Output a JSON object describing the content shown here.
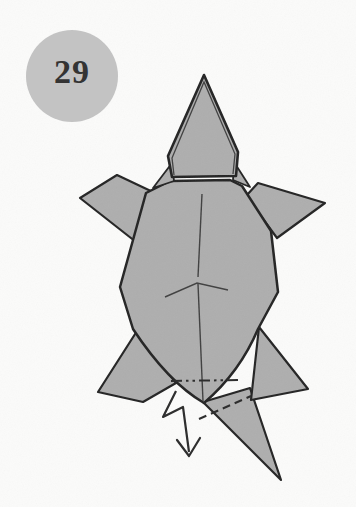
{
  "page": {
    "background": "#fbfbfa"
  },
  "step_badge": {
    "number": "29",
    "fill": "#c3c3c3",
    "text_color": "#343434"
  },
  "figure": {
    "name": "origami-turtle-top-view",
    "paper_fill": "#aeaeae",
    "outline_color": "#242424",
    "crease_color": "#404040",
    "annotation_color": "#2b2b2b",
    "annotations": {
      "mountain_fold_line": "dash-dot-dot line across shell bottom",
      "valley_fold_line": "dashed line across tail",
      "arrow": "zigzag crimp arrow pointing down"
    }
  }
}
